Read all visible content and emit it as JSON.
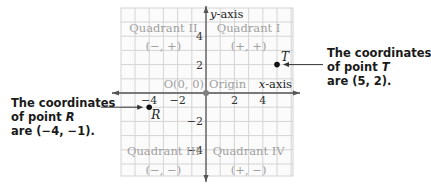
{
  "diagram": {
    "type": "coordinate-plane",
    "x_range": [
      -6,
      6
    ],
    "y_range": [
      -6,
      6
    ],
    "axes": {
      "x_label": "x-axis",
      "y_label": "y-axis",
      "x_ticks": [
        {
          "value": -4,
          "label": "−4"
        },
        {
          "value": -2,
          "label": "−2"
        },
        {
          "value": 2,
          "label": "2"
        },
        {
          "value": 4,
          "label": "4"
        }
      ],
      "y_ticks": [
        {
          "value": 4,
          "label": "4"
        },
        {
          "value": 2,
          "label": "2"
        },
        {
          "value": -2,
          "label": "−2"
        },
        {
          "value": -4,
          "label": "−4"
        }
      ]
    },
    "origin": {
      "label": "O(0, 0)",
      "name": "Origin"
    },
    "quadrants": [
      {
        "name": "Quadrant I",
        "signs": "(+, +)"
      },
      {
        "name": "Quadrant II",
        "signs": "(−, +)"
      },
      {
        "name": "Quadrant III",
        "signs": "(−, −)"
      },
      {
        "name": "Quadrant IV",
        "signs": "(+, −)"
      }
    ],
    "points": [
      {
        "label": "T",
        "x": 5,
        "y": 2
      },
      {
        "label": "R",
        "x": -4,
        "y": -1
      }
    ],
    "colors": {
      "grid": "#d4d4d4",
      "axis": "#555555",
      "quadrant_text": "#a0a0a0",
      "tick_text": "#333333",
      "point": "#111111",
      "origin_dot": "#808080"
    }
  },
  "callouts": {
    "t": {
      "line1": "The coordinates",
      "line2_prefix": "of point ",
      "line2_var": "T",
      "line3": "are (5, 2)."
    },
    "r": {
      "line1": "The coordinates",
      "line2_prefix": "of point ",
      "line2_var": "R",
      "line3": "are (−4, −1)."
    }
  }
}
